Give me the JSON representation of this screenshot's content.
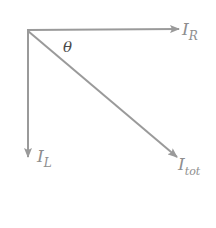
{
  "diagram": {
    "origin": {
      "x": 27,
      "y": 30
    },
    "colors": {
      "arrow": "#9a9a9a",
      "label": "#8e8e8e",
      "angle_label": "#4a4a4a",
      "background": "#ffffff"
    },
    "vectors": [
      {
        "id": "I_R",
        "main": "I",
        "subscript": "R",
        "end": {
          "x": 180,
          "y": 29
        }
      },
      {
        "id": "I_L",
        "main": "I",
        "subscript": "L",
        "end": {
          "x": 28,
          "y": 158
        }
      },
      {
        "id": "I_tot",
        "main": "I",
        "subscript": "tot",
        "end": {
          "x": 178,
          "y": 158
        }
      }
    ],
    "angle": {
      "symbol": "θ",
      "between": [
        "I_R",
        "I_tot"
      ]
    }
  }
}
